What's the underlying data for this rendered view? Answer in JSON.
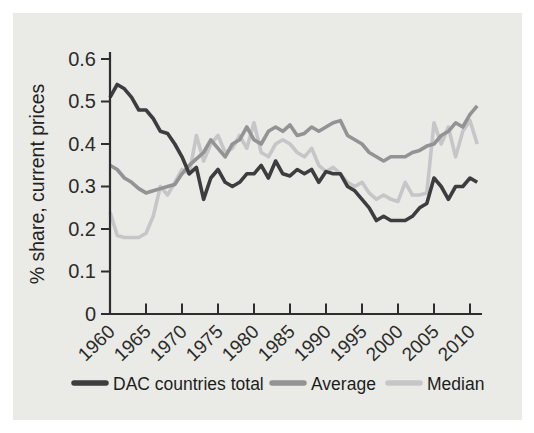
{
  "figure": {
    "page_bg": "#ffffff",
    "panel_bg": "#eaebe7",
    "axis_color": "#2e2e2e",
    "text_color": "#2b2b2b"
  },
  "chart_data": {
    "type": "line",
    "title": "",
    "xlabel": "",
    "ylabel": "% share, current prices",
    "ylim": [
      0,
      0.6
    ],
    "xlim": [
      1960,
      2011
    ],
    "grid": false,
    "legend_position": "bottom",
    "y_tick_values": [
      0,
      0.1,
      0.2,
      0.3,
      0.4,
      0.5,
      0.6
    ],
    "y_tick_labels": [
      "0",
      "0.1",
      "0.2",
      "0.3",
      "0.4",
      "0.5",
      "0.6"
    ],
    "x_tick_values": [
      1960,
      1965,
      1970,
      1975,
      1980,
      1985,
      1990,
      1995,
      2000,
      2005,
      2010
    ],
    "x_tick_labels": [
      "1960",
      "1965",
      "1970",
      "1975",
      "1980",
      "1985",
      "1990",
      "1995",
      "2000",
      "2005",
      "2010"
    ],
    "x": [
      1960,
      1961,
      1962,
      1963,
      1964,
      1965,
      1966,
      1967,
      1968,
      1969,
      1970,
      1971,
      1972,
      1973,
      1974,
      1975,
      1976,
      1977,
      1978,
      1979,
      1980,
      1981,
      1982,
      1983,
      1984,
      1985,
      1986,
      1987,
      1988,
      1989,
      1990,
      1991,
      1992,
      1993,
      1994,
      1995,
      1996,
      1997,
      1998,
      1999,
      2000,
      2001,
      2002,
      2003,
      2004,
      2005,
      2006,
      2007,
      2008,
      2009,
      2010,
      2011
    ],
    "series": [
      {
        "name": "DAC countries total",
        "color": "#3d3d3f",
        "values": [
          0.51,
          0.54,
          0.53,
          0.51,
          0.48,
          0.48,
          0.46,
          0.43,
          0.425,
          0.4,
          0.37,
          0.33,
          0.345,
          0.27,
          0.32,
          0.34,
          0.31,
          0.3,
          0.31,
          0.33,
          0.33,
          0.35,
          0.32,
          0.36,
          0.33,
          0.325,
          0.34,
          0.33,
          0.34,
          0.31,
          0.335,
          0.33,
          0.33,
          0.3,
          0.29,
          0.27,
          0.25,
          0.22,
          0.23,
          0.22,
          0.22,
          0.22,
          0.23,
          0.25,
          0.26,
          0.32,
          0.3,
          0.27,
          0.3,
          0.3,
          0.32,
          0.31
        ]
      },
      {
        "name": "Average",
        "color": "#939395",
        "values": [
          0.35,
          0.34,
          0.32,
          0.31,
          0.295,
          0.285,
          0.29,
          0.295,
          0.3,
          0.305,
          0.33,
          0.35,
          0.365,
          0.38,
          0.41,
          0.39,
          0.37,
          0.4,
          0.41,
          0.44,
          0.41,
          0.4,
          0.43,
          0.44,
          0.43,
          0.445,
          0.42,
          0.425,
          0.44,
          0.43,
          0.44,
          0.45,
          0.455,
          0.42,
          0.41,
          0.4,
          0.38,
          0.37,
          0.36,
          0.37,
          0.37,
          0.37,
          0.38,
          0.385,
          0.395,
          0.4,
          0.42,
          0.43,
          0.45,
          0.44,
          0.47,
          0.49
        ]
      },
      {
        "name": "Median",
        "color": "#c6c6c8",
        "values": [
          0.24,
          0.185,
          0.18,
          0.18,
          0.18,
          0.19,
          0.23,
          0.3,
          0.28,
          0.31,
          0.34,
          0.33,
          0.42,
          0.36,
          0.4,
          0.42,
          0.38,
          0.39,
          0.42,
          0.39,
          0.45,
          0.38,
          0.37,
          0.4,
          0.41,
          0.4,
          0.38,
          0.37,
          0.39,
          0.35,
          0.335,
          0.345,
          0.33,
          0.31,
          0.3,
          0.31,
          0.285,
          0.27,
          0.28,
          0.27,
          0.265,
          0.31,
          0.28,
          0.28,
          0.285,
          0.45,
          0.4,
          0.44,
          0.37,
          0.43,
          0.455,
          0.4
        ]
      }
    ]
  },
  "legend": {
    "items": [
      {
        "label": "DAC countries total"
      },
      {
        "label": "Average"
      },
      {
        "label": "Median"
      }
    ]
  }
}
